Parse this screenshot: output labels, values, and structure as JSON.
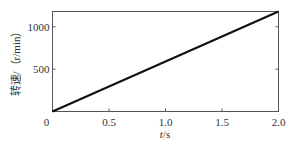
{
  "chart_data": {
    "type": "line",
    "title": "",
    "xlabel": "t/s",
    "ylabel": "转速/（r/min）",
    "xlim": [
      0,
      2.0
    ],
    "ylim": [
      0,
      1180
    ],
    "xticks": [
      "0",
      "0.5",
      "1.0",
      "1.5",
      "2.0"
    ],
    "yticks": [
      "500",
      "1000"
    ],
    "grid": false,
    "legend": null,
    "series": [
      {
        "name": "speed",
        "x": [
          0,
          0.5,
          1.0,
          1.5,
          2.0
        ],
        "values": [
          0,
          295,
          590,
          885,
          1180
        ]
      }
    ]
  },
  "axes": {
    "xlabel_italic": "t",
    "xlabel_unit": "/s",
    "ylabel": "转速/（r/min）",
    "origin_label": "0"
  }
}
